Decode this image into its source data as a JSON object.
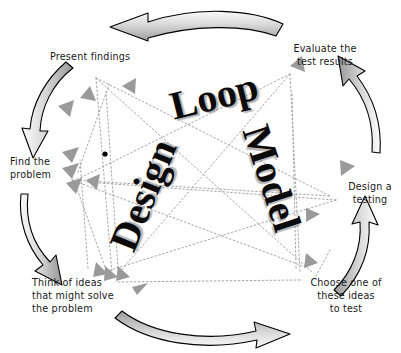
{
  "diagram": {
    "title_words": [
      {
        "text": "Design",
        "rotation": -68,
        "x": 143,
        "y": 195,
        "size": 40
      },
      {
        "text": "Loop",
        "rotation": -14,
        "x": 214,
        "y": 96,
        "size": 40
      },
      {
        "text": "Model",
        "rotation": 72,
        "x": 272,
        "y": 178,
        "size": 40
      }
    ],
    "full_title": "Design Loop Model",
    "stages": [
      {
        "id": "present-findings",
        "label": "Present findings",
        "x": 50,
        "y": 50
      },
      {
        "id": "evaluate-results",
        "label": "Evaluate the\ntest results",
        "x": 279,
        "y": 42
      },
      {
        "id": "find-problem",
        "label": "Find the\nproblem",
        "x": 10,
        "y": 155
      },
      {
        "id": "design-testing",
        "label": "Design a\ntesting",
        "x": 341,
        "y": 180
      },
      {
        "id": "think-ideas",
        "label": "Think of ideas\nthat might solve\nthe problem",
        "x": 32,
        "y": 276
      },
      {
        "id": "choose-idea",
        "label": "Choose one of\nthese ideas\nto test",
        "x": 296,
        "y": 276
      }
    ],
    "cycle_arrows": [
      {
        "id": "arrow-top",
        "direction": "counterclockwise-left"
      },
      {
        "id": "arrow-upper-left",
        "direction": "down-left"
      },
      {
        "id": "arrow-lower-left",
        "direction": "down-right"
      },
      {
        "id": "arrow-bottom",
        "direction": "right"
      },
      {
        "id": "arrow-lower-right",
        "direction": "up-right"
      },
      {
        "id": "arrow-upper-right",
        "direction": "up-left"
      }
    ],
    "colors": {
      "arrow_fill_light": "#f2f2f2",
      "arrow_fill_mid": "#b9b9b9",
      "arrow_fill_dark": "#8f8f8f",
      "arrow_stroke": "#000000",
      "connector_line": "#9b9b9b",
      "connector_head": "#9a9a9a",
      "text": "#1a1a1a",
      "wordmark": "#0b0b0b",
      "background": "#ffffff"
    },
    "connector_style": "dotted",
    "cropped_top_text": ""
  }
}
